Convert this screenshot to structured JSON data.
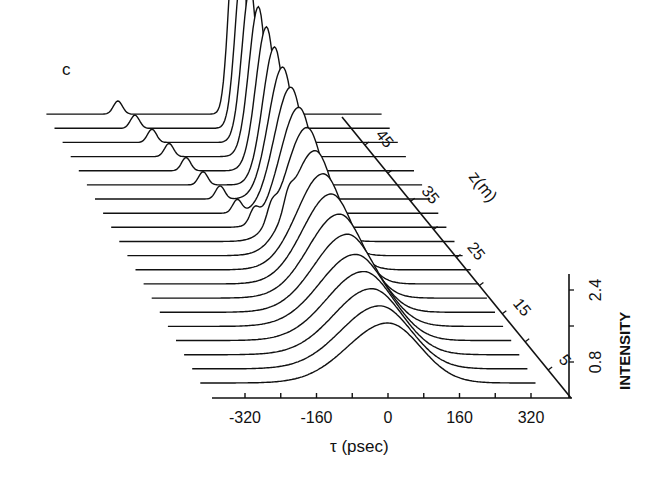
{
  "panel_label": "c",
  "chart_data": {
    "type": "waterfall-3d-line",
    "title": "",
    "panel_label": "c",
    "xlabel": "τ (psec)",
    "zlabel": "z(m)",
    "ylabel": "INTENSITY",
    "x_ticks": [
      -320,
      -160,
      0,
      160,
      320
    ],
    "x_tick_labels": [
      "-320",
      "-160",
      "0",
      "160",
      "320"
    ],
    "z_ticks": [
      5,
      15,
      25,
      35,
      45
    ],
    "z_tick_labels": [
      "5",
      "15",
      "25",
      "35",
      "45"
    ],
    "y_ticks": [
      0.8,
      2.4
    ],
    "y_tick_labels": [
      "0.8",
      "2.4"
    ],
    "xlim": [
      -400,
      400
    ],
    "zlim": [
      0,
      50
    ],
    "ylim": [
      0,
      3.2
    ],
    "n_traces": 20,
    "series": [
      {
        "name": "z=0",
        "z": 0,
        "peak_tau": 0,
        "peak_intensity": 1.0,
        "fwhm_psec": 170,
        "satellite_tau": null
      },
      {
        "name": "z=2.5",
        "z": 2.5,
        "peak_tau": 0,
        "peak_intensity": 1.05,
        "fwhm_psec": 165,
        "satellite_tau": null
      },
      {
        "name": "z=5",
        "z": 5,
        "peak_tau": 0,
        "peak_intensity": 1.1,
        "fwhm_psec": 160,
        "satellite_tau": null
      },
      {
        "name": "z=7.5",
        "z": 7.5,
        "peak_tau": 0,
        "peak_intensity": 1.15,
        "fwhm_psec": 155,
        "satellite_tau": null
      },
      {
        "name": "z=10",
        "z": 10,
        "peak_tau": 0,
        "peak_intensity": 1.2,
        "fwhm_psec": 150,
        "satellite_tau": null
      },
      {
        "name": "z=12.5",
        "z": 12.5,
        "peak_tau": 0,
        "peak_intensity": 1.3,
        "fwhm_psec": 140,
        "satellite_tau": null
      },
      {
        "name": "z=15",
        "z": 15,
        "peak_tau": 0,
        "peak_intensity": 1.4,
        "fwhm_psec": 130,
        "satellite_tau": null
      },
      {
        "name": "z=17.5",
        "z": 17.5,
        "peak_tau": 0,
        "peak_intensity": 1.5,
        "fwhm_psec": 120,
        "satellite_tau": null
      },
      {
        "name": "z=20",
        "z": 20,
        "peak_tau": 0,
        "peak_intensity": 1.6,
        "fwhm_psec": 110,
        "satellite_tau": null
      },
      {
        "name": "z=22.5",
        "z": 22.5,
        "peak_tau": 0,
        "peak_intensity": 1.75,
        "fwhm_psec": 100,
        "satellite_tau": -60
      },
      {
        "name": "z=25",
        "z": 25,
        "peak_tau": 0,
        "peak_intensity": 1.9,
        "fwhm_psec": 90,
        "satellite_tau": -80
      },
      {
        "name": "z=27.5",
        "z": 27.5,
        "peak_tau": 0,
        "peak_intensity": 2.0,
        "fwhm_psec": 80,
        "satellite_tau": -100
      },
      {
        "name": "z=30",
        "z": 30,
        "peak_tau": 0,
        "peak_intensity": 2.1,
        "fwhm_psec": 70,
        "satellite_tau": -120
      },
      {
        "name": "z=32.5",
        "z": 32.5,
        "peak_tau": 0,
        "peak_intensity": 2.2,
        "fwhm_psec": 60,
        "satellite_tau": -140
      },
      {
        "name": "z=35",
        "z": 35,
        "peak_tau": 0,
        "peak_intensity": 2.3,
        "fwhm_psec": 50,
        "satellite_tau": -160
      },
      {
        "name": "z=37.5",
        "z": 37.5,
        "peak_tau": 0,
        "peak_intensity": 2.4,
        "fwhm_psec": 45,
        "satellite_tau": -180
      },
      {
        "name": "z=40",
        "z": 40,
        "peak_tau": 0,
        "peak_intensity": 2.5,
        "fwhm_psec": 40,
        "satellite_tau": -200
      },
      {
        "name": "z=42.5",
        "z": 42.5,
        "peak_tau": 0,
        "peak_intensity": 2.6,
        "fwhm_psec": 35,
        "satellite_tau": -220
      },
      {
        "name": "z=45",
        "z": 45,
        "peak_tau": 0,
        "peak_intensity": 2.7,
        "fwhm_psec": 30,
        "satellite_tau": -240
      },
      {
        "name": "z=47.5",
        "z": 47.5,
        "peak_tau": 0,
        "peak_intensity": 2.8,
        "fwhm_psec": 25,
        "satellite_tau": -260
      }
    ]
  }
}
